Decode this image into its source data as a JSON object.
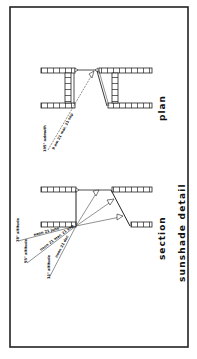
{
  "colors": {
    "background": "#ffffff",
    "ink": "#111111",
    "frame": "#222222"
  },
  "plan": {
    "title": "plan",
    "annotations": {
      "azimuth": "195° azimuth",
      "time": "9 am 21 mar. 21 sep"
    }
  },
  "section": {
    "title": "section",
    "altitudes": {
      "alt_78": "78° altitude",
      "alt_55": "55° altitude",
      "alt_31": "31° altitude"
    },
    "times": {
      "june": "noon 21 june",
      "mar_sep": "noon 21 mar. 21 sep",
      "dec": "noon 21 dec"
    }
  },
  "caption": "sunshade detail"
}
